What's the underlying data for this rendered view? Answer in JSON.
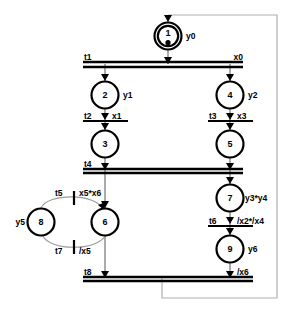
{
  "diagram": {
    "type": "sequential-function-chart",
    "title": "",
    "steps": [
      {
        "id": "s1",
        "number": "1",
        "action": "y0",
        "initial": true,
        "token": true,
        "cx": 168,
        "cy": 36
      },
      {
        "id": "s2",
        "number": "2",
        "action": "y1",
        "initial": false,
        "token": false,
        "cx": 105,
        "cy": 95
      },
      {
        "id": "s3",
        "number": "3",
        "action": "",
        "initial": false,
        "token": false,
        "cx": 105,
        "cy": 144
      },
      {
        "id": "s4",
        "number": "4",
        "action": "y2",
        "initial": false,
        "token": false,
        "cx": 230,
        "cy": 95
      },
      {
        "id": "s5",
        "number": "5",
        "action": "",
        "initial": false,
        "token": false,
        "cx": 230,
        "cy": 144
      },
      {
        "id": "s6",
        "number": "6",
        "action": "",
        "initial": false,
        "token": false,
        "cx": 105,
        "cy": 222
      },
      {
        "id": "s7",
        "number": "7",
        "action": "y3*y4",
        "initial": false,
        "token": false,
        "cx": 230,
        "cy": 198
      },
      {
        "id": "s8",
        "number": "8",
        "action": "y5",
        "initial": false,
        "token": false,
        "cx": 41,
        "cy": 222
      },
      {
        "id": "s9",
        "number": "9",
        "action": "y6",
        "initial": false,
        "token": false,
        "cx": 230,
        "cy": 249
      }
    ],
    "transitions": [
      {
        "id": "t1",
        "name": "t1",
        "condition": "x0",
        "kind": "double-divergence",
        "x1": 83,
        "x2": 243,
        "y": 64
      },
      {
        "id": "t2",
        "name": "t2",
        "condition": "x1",
        "kind": "single",
        "x1": 83,
        "x2": 128,
        "y": 120
      },
      {
        "id": "t3",
        "name": "t3",
        "condition": "x3",
        "kind": "single",
        "x1": 208,
        "x2": 253,
        "y": 120
      },
      {
        "id": "t4",
        "name": "t4",
        "condition": "",
        "kind": "double-convergence",
        "x1": 83,
        "x2": 243,
        "y": 170
      },
      {
        "id": "t5",
        "name": "t5",
        "condition": "x5*x6",
        "kind": "single-vertical",
        "x": 74,
        "y": 198
      },
      {
        "id": "t6",
        "name": "t6",
        "condition": "/x2*/x4",
        "kind": "single",
        "x1": 208,
        "x2": 253,
        "y": 224
      },
      {
        "id": "t7",
        "name": "t7",
        "condition": "/x5",
        "kind": "single-vertical",
        "x": 74,
        "y": 246
      },
      {
        "id": "t8",
        "name": "t8",
        "condition": "/x6",
        "kind": "double-convergence",
        "x1": 83,
        "x2": 253,
        "y": 278
      }
    ],
    "labels": {
      "t1": "t1",
      "x0": "x0",
      "t2": "t2",
      "x1": "x1",
      "t3": "t3",
      "x3": "x3",
      "t4": "t4",
      "t5": "t5",
      "cond5": "x5*x6",
      "t6": "t6",
      "cond6": "/x2*/x4",
      "t7": "t7",
      "cond7": "/x5",
      "t8": "t8",
      "cond8": "/x6",
      "y0": "y0",
      "y1": "y1",
      "y2": "y2",
      "y3y4": "y3*y4",
      "y5": "y5",
      "y6": "y6",
      "n1": "1",
      "n2": "2",
      "n3": "3",
      "n4": "4",
      "n5": "5",
      "n6": "6",
      "n7": "7",
      "n8": "8",
      "n9": "9"
    },
    "colors": {
      "stroke": "#000000",
      "flow": "#8f8f8f",
      "return": "#b0b0b0",
      "background": "#ffffff"
    }
  }
}
